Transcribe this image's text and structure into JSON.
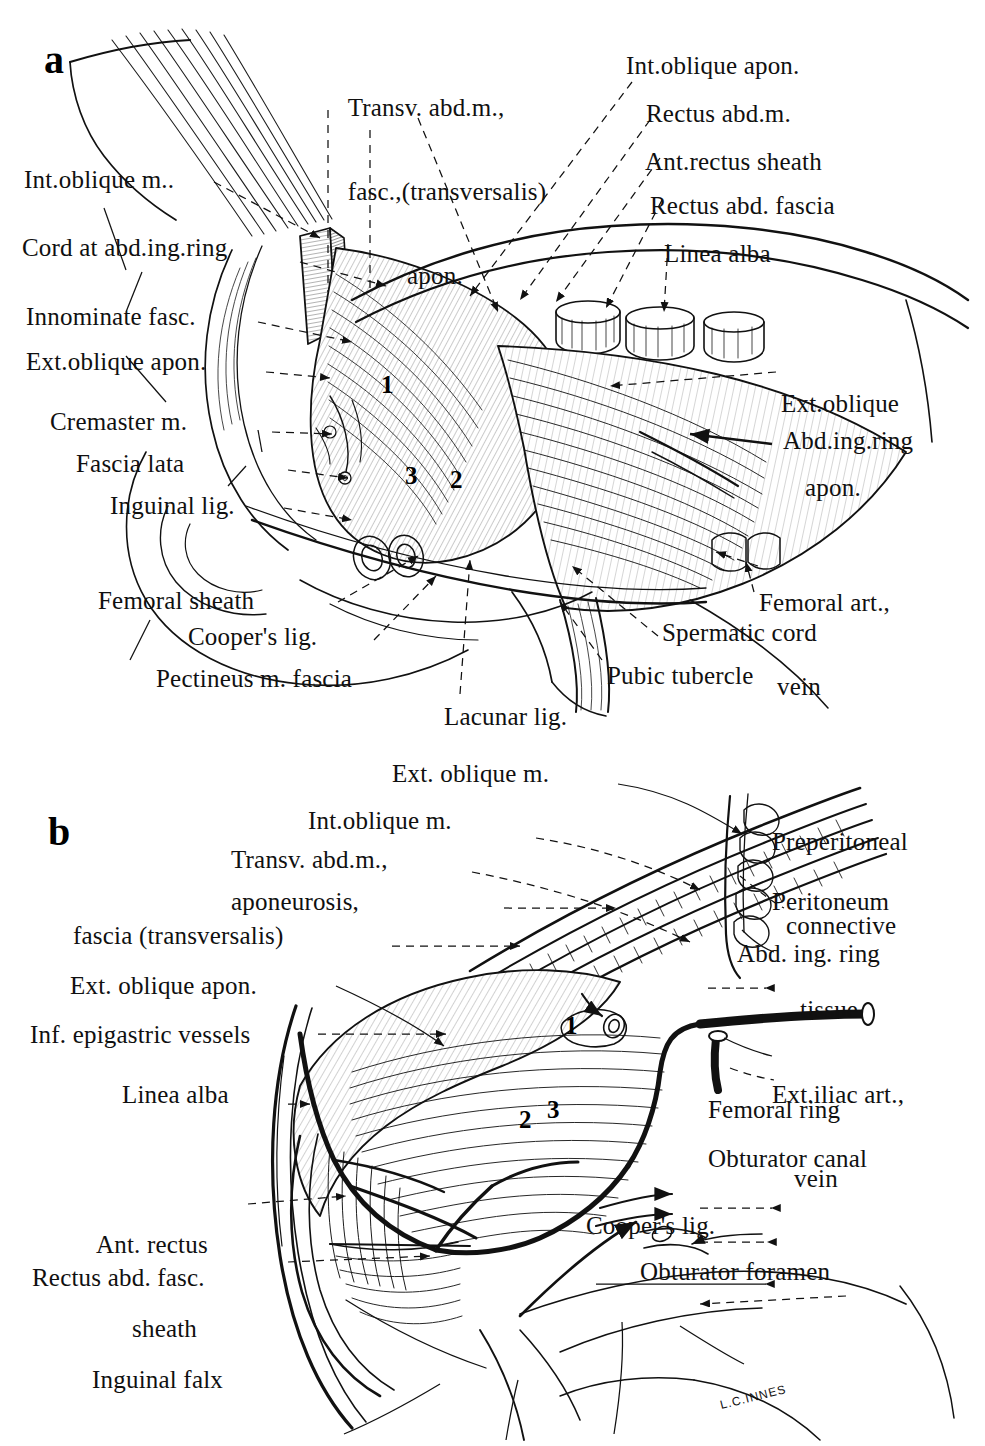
{
  "plate": {
    "signature": "L.C.INNES",
    "background": "#ffffff",
    "ink": "#101010"
  },
  "panel_a": {
    "letter": "a",
    "numbers": [
      "1",
      "2",
      "3"
    ],
    "labels_left": [
      {
        "name": "int-oblique-m",
        "text": "Int.oblique m.."
      },
      {
        "name": "cord-at-abd-ing-ring",
        "text": "Cord at abd.ing.ring"
      },
      {
        "name": "innominate-fasc",
        "text": "Innominate fasc."
      },
      {
        "name": "ext-oblique-apon",
        "text": "Ext.oblique apon."
      },
      {
        "name": "cremaster-m",
        "text": "Cremaster m."
      },
      {
        "name": "fascia-lata",
        "text": "Fascia lata"
      },
      {
        "name": "inguinal-lig",
        "text": "Inguinal lig."
      }
    ],
    "labels_top": [
      {
        "name": "transv-abd-m-line1",
        "text": "Transv. abd.m.,"
      },
      {
        "name": "transv-abd-m-line2",
        "text": "fasc.,(transversalis)"
      },
      {
        "name": "transv-abd-m-line3",
        "text": "apon."
      }
    ],
    "labels_right": [
      {
        "name": "int-oblique-apon",
        "text": "Int.oblique apon."
      },
      {
        "name": "rectus-abd-m",
        "text": "Rectus abd.m."
      },
      {
        "name": "ant-rectus-sheath",
        "text": "Ant.rectus sheath"
      },
      {
        "name": "rectus-abd-fascia",
        "text": "Rectus abd. fascia"
      },
      {
        "name": "linea-alba",
        "text": "Linea alba"
      },
      {
        "name": "ext-oblique-apon-line1",
        "text": "Ext.oblique"
      },
      {
        "name": "ext-oblique-apon-line2",
        "text": "apon."
      },
      {
        "name": "abd-ing-ring",
        "text": "Abd.ing.ring"
      },
      {
        "name": "femoral-art-line1",
        "text": "Femoral art.,"
      },
      {
        "name": "femoral-art-line2",
        "text": "vein"
      },
      {
        "name": "spermatic-cord",
        "text": "Spermatic cord"
      },
      {
        "name": "pubic-tubercle",
        "text": "Pubic tubercle"
      }
    ],
    "labels_bottom": [
      {
        "name": "femoral-sheath",
        "text": "Femoral sheath"
      },
      {
        "name": "coopers-lig",
        "text": "Cooper's lig."
      },
      {
        "name": "pectineus-m-fascia",
        "text": "Pectineus m. fascia"
      },
      {
        "name": "lacunar-lig",
        "text": "Lacunar lig."
      }
    ]
  },
  "panel_b": {
    "letter": "b",
    "numbers": [
      "1",
      "2",
      "3"
    ],
    "labels_top": [
      {
        "name": "ext-oblique-m",
        "text": "Ext. oblique m."
      },
      {
        "name": "int-oblique-m",
        "text": "Int.oblique m."
      },
      {
        "name": "transv-abd-m",
        "text": "Transv. abd.m.,"
      },
      {
        "name": "aponeurosis",
        "text": "aponeurosis,"
      },
      {
        "name": "fascia-transversalis",
        "text": "fascia (transversalis)"
      },
      {
        "name": "ext-oblique-apon",
        "text": "Ext. oblique apon."
      }
    ],
    "labels_left": [
      {
        "name": "inf-epigastric-vessels",
        "text": "Inf. epigastric vessels"
      },
      {
        "name": "linea-alba",
        "text": "Linea alba"
      },
      {
        "name": "ant-rectus-sheath-line1",
        "text": "Ant. rectus"
      },
      {
        "name": "ant-rectus-sheath-line2",
        "text": "sheath"
      },
      {
        "name": "rectus-abd-fasc",
        "text": "Rectus abd. fasc."
      },
      {
        "name": "inguinal-falx",
        "text": "Inguinal falx"
      }
    ],
    "labels_right": [
      {
        "name": "preperitoneal-line1",
        "text": "Preperitoneal"
      },
      {
        "name": "preperitoneal-line2",
        "text": "connective"
      },
      {
        "name": "preperitoneal-line3",
        "text": "tissue"
      },
      {
        "name": "peritoneum",
        "text": "Peritoneum"
      },
      {
        "name": "abd-ing-ring",
        "text": "Abd. ing. ring"
      },
      {
        "name": "ext-iliac-art-line1",
        "text": "Ext.iliac art.,"
      },
      {
        "name": "ext-iliac-art-line2",
        "text": "vein"
      },
      {
        "name": "femoral-ring",
        "text": "Femoral ring"
      },
      {
        "name": "obturator-canal",
        "text": "Obturator canal"
      },
      {
        "name": "coopers-lig",
        "text": "Cooper's lig."
      },
      {
        "name": "obturator-foramen",
        "text": "Obturator foramen"
      }
    ]
  }
}
